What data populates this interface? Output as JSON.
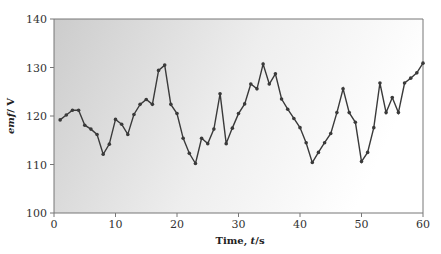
{
  "chart_data": {
    "type": "line",
    "title": "",
    "xlabel": "Time, t/s",
    "ylabel": "emf/ V",
    "xlim": [
      0,
      60
    ],
    "ylim": [
      100,
      140
    ],
    "xticks": [
      0,
      10,
      20,
      30,
      40,
      50,
      60
    ],
    "yticks": [
      100,
      110,
      120,
      130,
      140
    ],
    "grid": false,
    "legend": null,
    "series": [
      {
        "name": "emf",
        "color": "#3a3a3a",
        "x": [
          1,
          2,
          3,
          4,
          5,
          6,
          7,
          8,
          9,
          10,
          11,
          12,
          13,
          14,
          15,
          16,
          17,
          18,
          19,
          20,
          21,
          22,
          23,
          24,
          25,
          26,
          27,
          28,
          29,
          30,
          31,
          32,
          33,
          34,
          35,
          36,
          37,
          38,
          39,
          40,
          41,
          42,
          43,
          44,
          45,
          46,
          47,
          48,
          49,
          50,
          51,
          52,
          53,
          54,
          55,
          56,
          57,
          58,
          59,
          60
        ],
        "values": [
          119.2,
          120.2,
          121.2,
          121.2,
          118.1,
          117.3,
          116.2,
          112.1,
          114.2,
          119.3,
          118.3,
          116.2,
          120.3,
          122.4,
          123.4,
          122.4,
          129.4,
          130.5,
          122.4,
          120.5,
          115.4,
          112.3,
          110.2,
          115.4,
          114.3,
          117.3,
          124.6,
          114.3,
          117.5,
          120.5,
          122.5,
          126.6,
          125.6,
          130.7,
          126.6,
          128.7,
          123.5,
          121.4,
          119.5,
          117.6,
          114.5,
          110.4,
          112.5,
          114.5,
          116.4,
          120.7,
          125.6,
          120.7,
          118.7,
          110.6,
          112.5,
          117.6,
          126.8,
          120.7,
          123.8,
          120.7,
          126.8,
          127.8,
          128.9,
          130.9
        ]
      }
    ]
  },
  "axes": {
    "x_label_main": "Time, ",
    "x_label_var": "t",
    "x_label_unit": "/s",
    "y_label_var": "emf",
    "y_label_unit": "/ V"
  },
  "style": {
    "bg_left": "#cfcfcf",
    "bg_right": "#ffffff",
    "axis_color": "#777777",
    "line_color": "#3a3a3a"
  }
}
